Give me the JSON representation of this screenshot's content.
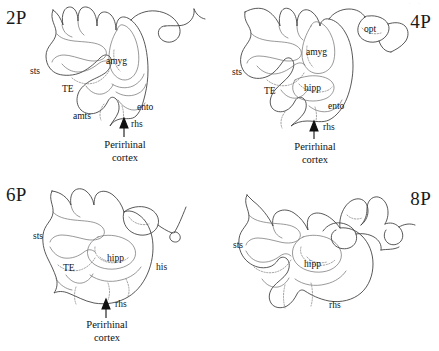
{
  "figure": {
    "title": "",
    "panel_count": 4,
    "style": "line-drawing coronal brain sections"
  },
  "panels": [
    {
      "id": "2P",
      "label": "2P",
      "position": "top-left",
      "annotations": [
        {
          "name": "sts",
          "text": "sts"
        },
        {
          "name": "TE",
          "text": "TE"
        },
        {
          "name": "amyg",
          "text": "amyg"
        },
        {
          "name": "amts",
          "text": "amts"
        },
        {
          "name": "ento",
          "text": "ento"
        },
        {
          "name": "rhs",
          "text": "rhs"
        }
      ],
      "callout": "Perirhinal\ncortex",
      "callout_line1": "Perirhinal",
      "callout_line2": "cortex"
    },
    {
      "id": "4P",
      "label": "4P",
      "position": "top-right",
      "annotations": [
        {
          "name": "sts",
          "text": "sts"
        },
        {
          "name": "TE",
          "text": "TE"
        },
        {
          "name": "amyg",
          "text": "amyg"
        },
        {
          "name": "hipp",
          "text": "hipp"
        },
        {
          "name": "ento",
          "text": "ento"
        },
        {
          "name": "opt",
          "text": "opt"
        },
        {
          "name": "rhs",
          "text": "rhs"
        }
      ],
      "callout_line1": "Perirhinal",
      "callout_line2": "cortex"
    },
    {
      "id": "6P",
      "label": "6P",
      "position": "bottom-left",
      "annotations": [
        {
          "name": "sts",
          "text": "sts"
        },
        {
          "name": "TE",
          "text": "TE"
        },
        {
          "name": "hipp",
          "text": "hipp"
        },
        {
          "name": "his",
          "text": "his"
        },
        {
          "name": "rhs",
          "text": "rhs"
        }
      ],
      "callout_line1": "Perirhinal",
      "callout_line2": "cortex"
    },
    {
      "id": "8P",
      "label": "8P",
      "position": "bottom-right",
      "annotations": [
        {
          "name": "sts",
          "text": "sts"
        },
        {
          "name": "hipp",
          "text": "hipp"
        },
        {
          "name": "rhs",
          "text": "rhs"
        }
      ],
      "callout_line1": "",
      "callout_line2": ""
    }
  ],
  "colors": {
    "outline": "#3a3a3a",
    "inner": "#6d6d6d",
    "dotted": "#7a7a7a",
    "text": "#111111",
    "background": "#ffffff"
  }
}
